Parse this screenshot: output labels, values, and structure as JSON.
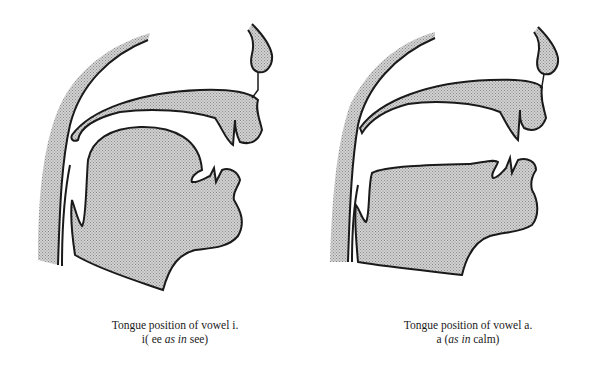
{
  "figures": [
    {
      "caption_line1": "Tongue position of vowel i.",
      "caption_line2_pre": "i( ee ",
      "caption_line2_italic": "as in",
      "caption_line2_post": " see)"
    },
    {
      "caption_line1": "Tongue position of vowel a.",
      "caption_line2_pre": "a (",
      "caption_line2_italic": "as in",
      "caption_line2_post": " calm)"
    }
  ],
  "colors": {
    "fill": "#c4c4c4",
    "stroke": "#1a1a1a",
    "background": "#ffffff"
  }
}
